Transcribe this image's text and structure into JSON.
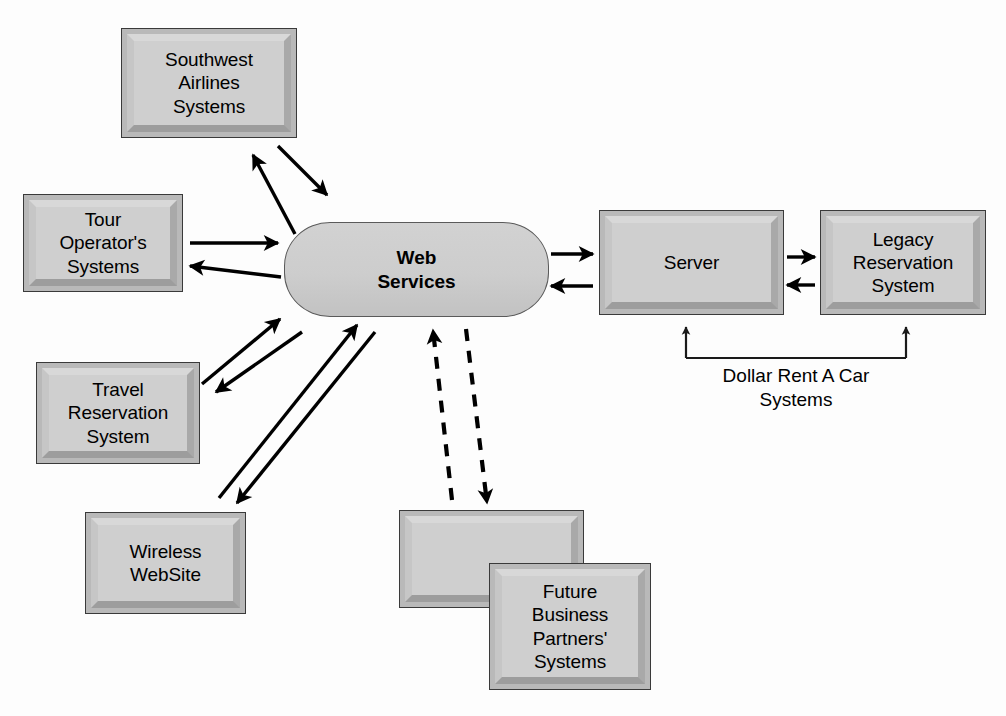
{
  "diagram": {
    "background_color": "#fdfdfd",
    "box_fill_color": "#cfcfcf",
    "box_border_color": "#3a3a3a",
    "connector_color": "#000000",
    "nodes": [
      {
        "id": "southwest-airlines-systems",
        "label": "Southwest\nAirlines\nSystems",
        "shape": "beveled-box",
        "x": 121,
        "y": 28,
        "width": 176,
        "height": 110
      },
      {
        "id": "tour-operators-systems",
        "label": "Tour\nOperator's\nSystems",
        "shape": "beveled-box",
        "x": 23,
        "y": 194,
        "width": 160,
        "height": 98
      },
      {
        "id": "travel-reservation-system",
        "label": "Travel\nReservation\nSystem",
        "shape": "beveled-box",
        "x": 36,
        "y": 362,
        "width": 164,
        "height": 102
      },
      {
        "id": "wireless-website",
        "label": "Wireless\nWebSite",
        "shape": "beveled-box",
        "x": 85,
        "y": 512,
        "width": 161,
        "height": 102
      },
      {
        "id": "web-services",
        "label": "Web\nServices",
        "shape": "rounded-stadium",
        "x": 284,
        "y": 222,
        "width": 265,
        "height": 95
      },
      {
        "id": "server",
        "label": "Server",
        "shape": "beveled-box",
        "x": 599,
        "y": 210,
        "width": 185,
        "height": 105
      },
      {
        "id": "legacy-reservation-system",
        "label": "Legacy\nReservation\nSystem",
        "shape": "beveled-box",
        "x": 820,
        "y": 210,
        "width": 166,
        "height": 105
      },
      {
        "id": "future-partners-back-box",
        "label": "",
        "shape": "beveled-box",
        "x": 399,
        "y": 510,
        "width": 185,
        "height": 98
      },
      {
        "id": "future-business-partners-systems",
        "label": "Future\nBusiness\nPartners'\nSystems",
        "shape": "beveled-box",
        "x": 489,
        "y": 563,
        "width": 162,
        "height": 127
      }
    ],
    "labels": [
      {
        "id": "dollar-rent-a-car-systems",
        "text": "Dollar Rent A Car\nSystems",
        "x": 700,
        "y": 366,
        "width": 250
      }
    ],
    "connectors": [
      {
        "id": "southwest-to-web-services",
        "from": "southwest-airlines-systems",
        "to": "web-services",
        "style": "solid",
        "direction": "forward"
      },
      {
        "id": "web-services-to-southwest",
        "from": "web-services",
        "to": "southwest-airlines-systems",
        "style": "solid",
        "direction": "forward"
      },
      {
        "id": "tour-operator-to-web-services",
        "from": "tour-operators-systems",
        "to": "web-services",
        "style": "solid",
        "direction": "forward"
      },
      {
        "id": "web-services-to-tour-operator",
        "from": "web-services",
        "to": "tour-operators-systems",
        "style": "solid",
        "direction": "forward"
      },
      {
        "id": "travel-reservation-to-web-services",
        "from": "travel-reservation-system",
        "to": "web-services",
        "style": "solid",
        "direction": "forward"
      },
      {
        "id": "web-services-to-travel-reservation",
        "from": "web-services",
        "to": "travel-reservation-system",
        "style": "solid",
        "direction": "forward"
      },
      {
        "id": "wireless-website-to-web-services",
        "from": "wireless-website",
        "to": "web-services",
        "style": "solid",
        "direction": "forward"
      },
      {
        "id": "web-services-to-wireless-website",
        "from": "web-services",
        "to": "wireless-website",
        "style": "solid",
        "direction": "forward"
      },
      {
        "id": "future-partners-to-web-services",
        "from": "future-partners-back-box",
        "to": "web-services",
        "style": "dashed",
        "direction": "forward"
      },
      {
        "id": "web-services-to-future-partners",
        "from": "web-services",
        "to": "future-partners-back-box",
        "style": "dashed",
        "direction": "forward"
      },
      {
        "id": "web-services-to-server",
        "from": "web-services",
        "to": "server",
        "style": "solid",
        "direction": "forward"
      },
      {
        "id": "server-to-web-services",
        "from": "server",
        "to": "web-services",
        "style": "solid",
        "direction": "forward"
      },
      {
        "id": "server-to-legacy",
        "from": "server",
        "to": "legacy-reservation-system",
        "style": "solid",
        "direction": "forward"
      },
      {
        "id": "legacy-to-server",
        "from": "legacy-reservation-system",
        "to": "server",
        "style": "solid",
        "direction": "forward"
      },
      {
        "id": "dollar-bracket",
        "from": "dollar-rent-a-car-systems",
        "to": "server-and-legacy",
        "style": "bracket",
        "direction": "both-up"
      }
    ]
  }
}
